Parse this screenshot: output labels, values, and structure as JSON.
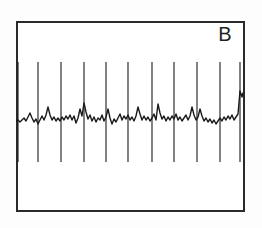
{
  "figure": {
    "panel_label": "B",
    "background_color": "#fdfdfd",
    "frame_color": "#2a2a2a",
    "trace_color": "#1a1a1a",
    "frame": {
      "x": 16,
      "y": 21,
      "width": 229,
      "height": 191,
      "border_width": 2.2
    }
  },
  "chart_data": {
    "type": "line",
    "title": "B",
    "xlabel": "",
    "ylabel": "",
    "grid": false,
    "legend": null,
    "axis_visible": false,
    "xlim": [
      0,
      229
    ],
    "ylim": [
      0,
      191
    ],
    "series": [
      {
        "name": "spike-markers",
        "type": "vertical-lines",
        "color": "#1a1a1a",
        "line_width": 1.1,
        "y_top": 41,
        "y_bottom": 141,
        "x": [
          2,
          22,
          45,
          68,
          90,
          112,
          136,
          158,
          181,
          204,
          224
        ]
      },
      {
        "name": "baseline-signal",
        "type": "line",
        "color": "#1a1a1a",
        "line_width": 1.4,
        "baseline_y": 97,
        "points": [
          [
            0,
            100
          ],
          [
            2,
            99
          ],
          [
            4,
            101
          ],
          [
            6,
            99
          ],
          [
            8,
            97
          ],
          [
            10,
            100
          ],
          [
            12,
            96
          ],
          [
            14,
            92
          ],
          [
            16,
            97
          ],
          [
            18,
            101
          ],
          [
            20,
            98
          ],
          [
            22,
            103
          ],
          [
            24,
            99
          ],
          [
            26,
            95
          ],
          [
            28,
            99
          ],
          [
            30,
            94
          ],
          [
            32,
            86
          ],
          [
            34,
            94
          ],
          [
            36,
            99
          ],
          [
            38,
            96
          ],
          [
            40,
            100
          ],
          [
            42,
            97
          ],
          [
            44,
            100
          ],
          [
            46,
            96
          ],
          [
            48,
            99
          ],
          [
            50,
            95
          ],
          [
            52,
            98
          ],
          [
            54,
            94
          ],
          [
            56,
            99
          ],
          [
            58,
            95
          ],
          [
            60,
            102
          ],
          [
            62,
            97
          ],
          [
            64,
            88
          ],
          [
            66,
            95
          ],
          [
            68,
            82
          ],
          [
            70,
            91
          ],
          [
            72,
            98
          ],
          [
            74,
            94
          ],
          [
            76,
            100
          ],
          [
            78,
            96
          ],
          [
            80,
            101
          ],
          [
            82,
            97
          ],
          [
            84,
            99
          ],
          [
            86,
            94
          ],
          [
            88,
            100
          ],
          [
            90,
            96
          ],
          [
            92,
            88
          ],
          [
            94,
            97
          ],
          [
            96,
            103
          ],
          [
            98,
            98
          ],
          [
            100,
            101
          ],
          [
            102,
            97
          ],
          [
            104,
            93
          ],
          [
            106,
            99
          ],
          [
            108,
            95
          ],
          [
            110,
            98
          ],
          [
            112,
            94
          ],
          [
            114,
            99
          ],
          [
            116,
            96
          ],
          [
            118,
            100
          ],
          [
            120,
            95
          ],
          [
            122,
            86
          ],
          [
            124,
            93
          ],
          [
            126,
            99
          ],
          [
            128,
            95
          ],
          [
            130,
            99
          ],
          [
            132,
            96
          ],
          [
            134,
            100
          ],
          [
            136,
            97
          ],
          [
            138,
            93
          ],
          [
            140,
            99
          ],
          [
            142,
            83
          ],
          [
            144,
            92
          ],
          [
            146,
            98
          ],
          [
            148,
            95
          ],
          [
            150,
            100
          ],
          [
            152,
            96
          ],
          [
            154,
            99
          ],
          [
            156,
            95
          ],
          [
            158,
            98
          ],
          [
            160,
            93
          ],
          [
            162,
            99
          ],
          [
            164,
            96
          ],
          [
            166,
            100
          ],
          [
            168,
            97
          ],
          [
            170,
            94
          ],
          [
            172,
            99
          ],
          [
            174,
            95
          ],
          [
            176,
            86
          ],
          [
            178,
            94
          ],
          [
            180,
            99
          ],
          [
            182,
            96
          ],
          [
            184,
            88
          ],
          [
            186,
            95
          ],
          [
            188,
            100
          ],
          [
            190,
            97
          ],
          [
            192,
            101
          ],
          [
            194,
            98
          ],
          [
            196,
            102
          ],
          [
            198,
            99
          ],
          [
            200,
            103
          ],
          [
            202,
            100
          ],
          [
            204,
            97
          ],
          [
            206,
            100
          ],
          [
            208,
            96
          ],
          [
            210,
            99
          ],
          [
            212,
            95
          ],
          [
            214,
            98
          ],
          [
            216,
            94
          ],
          [
            218,
            99
          ],
          [
            220,
            96
          ],
          [
            222,
            93
          ],
          [
            224,
            70
          ],
          [
            226,
            76
          ],
          [
            227,
            72
          ]
        ]
      }
    ]
  }
}
